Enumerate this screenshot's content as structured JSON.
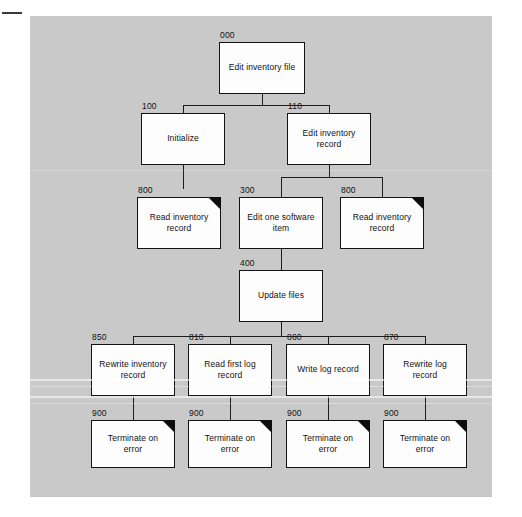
{
  "diagram": {
    "background_color": "#c9c9c9",
    "box_fill": "#fdfdfd",
    "line_color": "#1c1c1c",
    "flag_color": "#0d0d0d"
  },
  "nodes": [
    {
      "id": "n000",
      "ref": "000",
      "label": "Edit inventory file",
      "flag": false,
      "x": 219,
      "y": 42,
      "w": 86,
      "h": 52
    },
    {
      "id": "n100",
      "ref": "100",
      "label": "Initialize",
      "flag": false,
      "x": 141,
      "y": 113,
      "w": 84,
      "h": 52
    },
    {
      "id": "n110",
      "ref": "110",
      "label": "Edit inventory record",
      "flag": false,
      "x": 287,
      "y": 113,
      "w": 84,
      "h": 52
    },
    {
      "id": "n800a",
      "ref": "800",
      "label": "Read inventory record",
      "flag": true,
      "x": 137,
      "y": 197,
      "w": 84,
      "h": 52
    },
    {
      "id": "n300",
      "ref": "300",
      "label": "Edit one software item",
      "flag": false,
      "x": 239,
      "y": 197,
      "w": 84,
      "h": 52
    },
    {
      "id": "n800b",
      "ref": "800",
      "label": "Read inventory record",
      "flag": true,
      "x": 340,
      "y": 197,
      "w": 84,
      "h": 52
    },
    {
      "id": "n400",
      "ref": "400",
      "label": "Update files",
      "flag": false,
      "x": 239,
      "y": 270,
      "w": 84,
      "h": 52
    },
    {
      "id": "n850",
      "ref": "850",
      "label": "Rewrite inventory record",
      "flag": false,
      "x": 91,
      "y": 344,
      "w": 84,
      "h": 52
    },
    {
      "id": "n810",
      "ref": "810",
      "label": "Read first log record",
      "flag": false,
      "x": 188,
      "y": 344,
      "w": 84,
      "h": 52
    },
    {
      "id": "n860",
      "ref": "860",
      "label": "Write log record",
      "flag": false,
      "x": 286,
      "y": 344,
      "w": 84,
      "h": 52
    },
    {
      "id": "n870",
      "ref": "870",
      "label": "Rewrite log record",
      "flag": false,
      "x": 383,
      "y": 344,
      "w": 84,
      "h": 52
    },
    {
      "id": "n900a",
      "ref": "900",
      "label": "Terminate on error",
      "flag": true,
      "x": 91,
      "y": 420,
      "w": 84,
      "h": 48
    },
    {
      "id": "n900b",
      "ref": "900",
      "label": "Terminate on error",
      "flag": true,
      "x": 188,
      "y": 420,
      "w": 84,
      "h": 48
    },
    {
      "id": "n900c",
      "ref": "900",
      "label": "Terminate on error",
      "flag": true,
      "x": 286,
      "y": 420,
      "w": 84,
      "h": 48
    },
    {
      "id": "n900d",
      "ref": "900",
      "label": "Terminate on error",
      "flag": true,
      "x": 383,
      "y": 420,
      "w": 84,
      "h": 48
    }
  ],
  "connectors": [
    {
      "type": "v",
      "x": 262,
      "y": 94,
      "len": 12
    },
    {
      "type": "h",
      "x": 183,
      "y": 105,
      "len": 146
    },
    {
      "type": "v",
      "x": 183,
      "y": 105,
      "len": 8
    },
    {
      "type": "v",
      "x": 329,
      "y": 105,
      "len": 8
    },
    {
      "type": "v",
      "x": 183,
      "y": 165,
      "len": 24
    },
    {
      "type": "v",
      "x": 329,
      "y": 165,
      "len": 12
    },
    {
      "type": "h",
      "x": 281,
      "y": 177,
      "len": 101
    },
    {
      "type": "v",
      "x": 281,
      "y": 177,
      "len": 20
    },
    {
      "type": "v",
      "x": 382,
      "y": 177,
      "len": 20
    },
    {
      "type": "v",
      "x": 281,
      "y": 249,
      "len": 21
    },
    {
      "type": "v",
      "x": 281,
      "y": 322,
      "len": 14
    },
    {
      "type": "h",
      "x": 133,
      "y": 336,
      "len": 292
    },
    {
      "type": "v",
      "x": 133,
      "y": 336,
      "len": 8
    },
    {
      "type": "v",
      "x": 230,
      "y": 336,
      "len": 8
    },
    {
      "type": "v",
      "x": 328,
      "y": 336,
      "len": 8
    },
    {
      "type": "v",
      "x": 425,
      "y": 336,
      "len": 8
    },
    {
      "type": "v",
      "x": 133,
      "y": 396,
      "len": 24
    },
    {
      "type": "v",
      "x": 230,
      "y": 396,
      "len": 24
    },
    {
      "type": "v",
      "x": 328,
      "y": 396,
      "len": 24
    },
    {
      "type": "v",
      "x": 425,
      "y": 396,
      "len": 24
    }
  ]
}
